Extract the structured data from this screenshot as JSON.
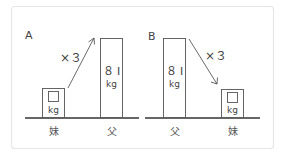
{
  "panels": [
    {
      "label": "A",
      "multiplier": "×３",
      "left_person": "妹",
      "right_person": "父",
      "small_box": {
        "unknown": "□",
        "unit": "kg"
      },
      "tall_box": {
        "value": "８ I",
        "unit": "kg"
      },
      "arrow_direction": "up-right"
    },
    {
      "label": "B",
      "multiplier": "×３",
      "left_person": "父",
      "right_person": "妹",
      "tall_box": {
        "value": "８ I",
        "unit": "kg"
      },
      "small_box": {
        "unknown": "□",
        "unit": "kg"
      },
      "arrow_direction": "down-right"
    }
  ]
}
